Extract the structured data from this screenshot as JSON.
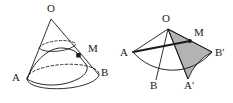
{
  "figure": {
    "background_color": "#ffffff",
    "stroke_color": "#1a1a1a",
    "shade_color": "#b3b3b3",
    "left_figure": {
      "name": "cone-diagram",
      "labels": [
        {
          "id": "O",
          "text": "O",
          "x": 51,
          "y": 12
        },
        {
          "id": "M",
          "text": "M",
          "x": 88,
          "y": 52
        },
        {
          "id": "A",
          "text": "A",
          "x": 12,
          "y": 81
        },
        {
          "id": "B",
          "text": "B",
          "x": 101,
          "y": 76
        }
      ],
      "apex": {
        "x": 51,
        "y": 19
      },
      "base_center": {
        "x": 63,
        "y": 79
      },
      "base_rx": 36,
      "base_ry": 12,
      "point_A": {
        "x": 27,
        "y": 80
      },
      "point_B": {
        "x": 99,
        "y": 76
      },
      "point_M": {
        "x": 79,
        "y": 56
      }
    },
    "right_figure": {
      "name": "unrolled-sector-diagram",
      "labels": [
        {
          "id": "O",
          "text": "O",
          "x": 166,
          "y": 22
        },
        {
          "id": "M",
          "text": "M",
          "x": 194,
          "y": 36
        },
        {
          "id": "A",
          "text": "A",
          "x": 120,
          "y": 56
        },
        {
          "id": "Bprime",
          "text": "B′",
          "x": 215,
          "y": 56
        },
        {
          "id": "B",
          "text": "B",
          "x": 150,
          "y": 89
        },
        {
          "id": "Aprime",
          "text": "A′",
          "x": 184,
          "y": 89
        }
      ],
      "apex": {
        "x": 168,
        "y": 29
      },
      "radius": 52,
      "point_A": {
        "x": 133,
        "y": 52
      },
      "point_B": {
        "x": 156,
        "y": 80
      },
      "point_Aprime": {
        "x": 188,
        "y": 79
      },
      "point_Bprime": {
        "x": 212,
        "y": 52
      },
      "point_M": {
        "x": 190,
        "y": 41
      },
      "shaded_sector": "O-M-A′-B′"
    }
  }
}
